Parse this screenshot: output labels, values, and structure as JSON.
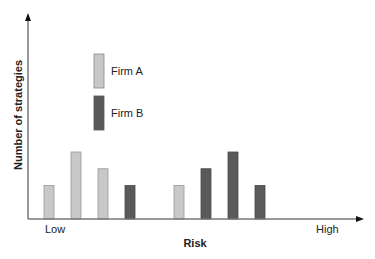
{
  "chart_data": {
    "type": "bar",
    "title": "",
    "xlabel": "Risk",
    "ylabel": "Number of strategies",
    "x_tick_labels": {
      "low": "Low",
      "high": "High"
    },
    "ylim": [
      0,
      6
    ],
    "grid": false,
    "legend_placement": "top-left",
    "categories": [
      "1",
      "2",
      "3",
      "4",
      "5",
      "6",
      "7",
      "8"
    ],
    "series": [
      {
        "name": "Firm A",
        "color": "#c8c8c8",
        "values": [
          2,
          4,
          3,
          null,
          2,
          null,
          null,
          null
        ]
      },
      {
        "name": "Firm B",
        "color": "#5a5a5a",
        "values": [
          null,
          null,
          null,
          2,
          null,
          3,
          4,
          2
        ]
      }
    ],
    "legend": [
      {
        "label": "Firm A",
        "color": "#c8c8c8"
      },
      {
        "label": "Firm B",
        "color": "#5a5a5a"
      }
    ]
  }
}
